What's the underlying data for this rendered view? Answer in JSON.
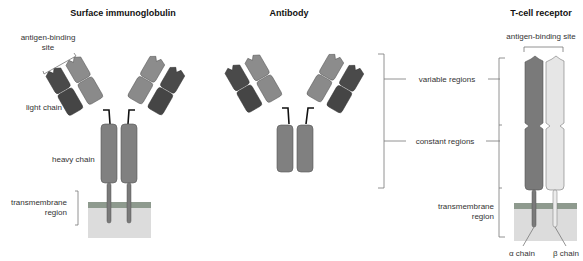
{
  "panels": {
    "surface_ig": {
      "title": "Surface immunoglobulin",
      "labels": {
        "antigen_binding_1": "antigen-binding",
        "antigen_binding_2": "site",
        "light_chain": "light chain",
        "heavy_chain": "heavy chain",
        "transmembrane_1": "transmembrane",
        "transmembrane_2": "region"
      }
    },
    "antibody": {
      "title": "Antibody"
    },
    "tcr": {
      "title": "T-cell receptor",
      "labels": {
        "antigen_binding": "antigen-binding site",
        "transmembrane_1": "transmembrane",
        "transmembrane_2": "region",
        "alpha_chain": "α chain",
        "beta_chain": "β chain"
      }
    }
  },
  "regions": {
    "variable": "variable regions",
    "constant": "constant regions"
  },
  "colors": {
    "light_chain": "#4a4a4a",
    "heavy_chain_v": "#8c8c8c",
    "heavy_chain_c": "#7f7f7f",
    "alpha_chain": "#7a7a7a",
    "beta_chain": "#e4e4e4",
    "membrane_band": "#8e9a8e",
    "membrane_fill": "#dcdcdc"
  }
}
